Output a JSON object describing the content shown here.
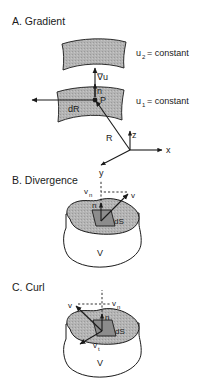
{
  "figure": {
    "background_color": "#ffffff",
    "ink_color": "#1a1a1a",
    "surface_fill": "#b2b2b2",
    "volume_fill": "#ffffff",
    "width": 204,
    "height": 380
  },
  "panels": [
    {
      "id": "gradient",
      "heading": "A. Gradient",
      "labels": {
        "grad_u": "∇u",
        "normal": "n",
        "point": "P",
        "dR": "dR",
        "R": "R",
        "axis_x": "x",
        "axis_y": "y",
        "axis_z": "z",
        "upper_surface": "u",
        "upper_surface_sub": "2",
        "upper_surface_eq": "= constant",
        "lower_surface": "u",
        "lower_surface_sub": "1",
        "lower_surface_eq": "= constant"
      }
    },
    {
      "id": "divergence",
      "heading": "B. Divergence",
      "labels": {
        "v_normal": "v",
        "v_normal_sub": "n",
        "v": "v",
        "normal": "n",
        "dS": "dS",
        "volume": "V"
      }
    },
    {
      "id": "curl",
      "heading": "C. Curl",
      "labels": {
        "v": "v",
        "v_normal": "v",
        "v_normal_sub": "n",
        "normal": "n",
        "v_tangential": "v",
        "v_tangential_sub": "t",
        "dS": "dS",
        "volume": "V"
      }
    }
  ]
}
